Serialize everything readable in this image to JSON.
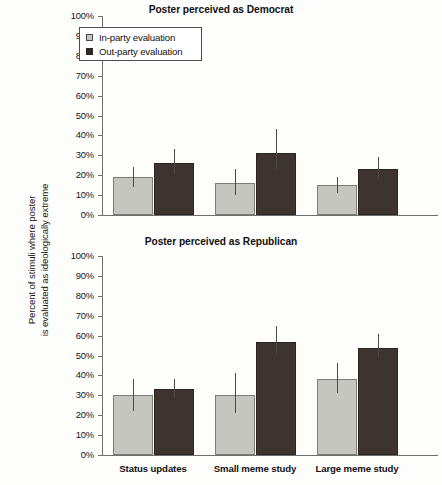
{
  "figure": {
    "ylabel_line1": "Percent of stimuli where poster",
    "ylabel_line2": "is evaluated as ideologically extreme"
  },
  "legend": {
    "items": [
      {
        "label": "In-party evaluation",
        "key": "inparty",
        "color": "#c6c6c0"
      },
      {
        "label": "Out-party evaluation",
        "key": "outparty",
        "color": "#2e2724"
      }
    ]
  },
  "axis": {
    "ticks": [
      "100%",
      "90%",
      "80%",
      "70%",
      "60%",
      "50%",
      "40%",
      "30%",
      "20%",
      "10%",
      "0%"
    ],
    "tick_values": [
      100,
      90,
      80,
      70,
      60,
      50,
      40,
      30,
      20,
      10,
      0
    ]
  },
  "categories": [
    "Status updates",
    "Small meme study",
    "Large meme study"
  ],
  "chart_data": [
    {
      "type": "bar",
      "title": "Poster perceived as Democrat",
      "panel": "top",
      "xlabel": "",
      "ylabel": "Percent of stimuli where poster is evaluated as ideologically extreme",
      "ylim": [
        0,
        100
      ],
      "yticks": [
        0,
        10,
        20,
        30,
        40,
        50,
        60,
        70,
        80,
        90,
        100
      ],
      "ytick_labels": [
        "0%",
        "10%",
        "20%",
        "30%",
        "40%",
        "50%",
        "60%",
        "70%",
        "80%",
        "90%",
        "100%"
      ],
      "grid": false,
      "legend_position": "upper-left",
      "categories": [
        "Status updates",
        "Small meme study",
        "Large meme study"
      ],
      "series": [
        {
          "name": "In-party evaluation",
          "color": "#c6c6c0",
          "values": [
            19,
            16,
            15
          ],
          "err_low": [
            14,
            10,
            11
          ],
          "err_high": [
            24,
            23,
            19
          ]
        },
        {
          "name": "Out-party evaluation",
          "color": "#2e2724",
          "values": [
            26,
            31,
            23
          ],
          "err_low": [
            21,
            23,
            18
          ],
          "err_high": [
            33,
            43,
            29
          ]
        }
      ]
    },
    {
      "type": "bar",
      "title": "Poster perceived as Republican",
      "panel": "bottom",
      "xlabel": "",
      "ylabel": "Percent of stimuli where poster is evaluated as ideologically extreme",
      "ylim": [
        0,
        100
      ],
      "yticks": [
        0,
        10,
        20,
        30,
        40,
        50,
        60,
        70,
        80,
        90,
        100
      ],
      "ytick_labels": [
        "0%",
        "10%",
        "20%",
        "30%",
        "40%",
        "50%",
        "60%",
        "70%",
        "80%",
        "90%",
        "100%"
      ],
      "grid": false,
      "legend_position": "none",
      "categories": [
        "Status updates",
        "Small meme study",
        "Large meme study"
      ],
      "series": [
        {
          "name": "In-party evaluation",
          "color": "#c6c6c0",
          "values": [
            30,
            30,
            38
          ],
          "err_low": [
            22,
            21,
            31
          ],
          "err_high": [
            38,
            41,
            46
          ]
        },
        {
          "name": "Out-party evaluation",
          "color": "#2e2724",
          "values": [
            33,
            57,
            54
          ],
          "err_low": [
            29,
            51,
            49
          ],
          "err_high": [
            38,
            65,
            61
          ]
        }
      ]
    }
  ]
}
